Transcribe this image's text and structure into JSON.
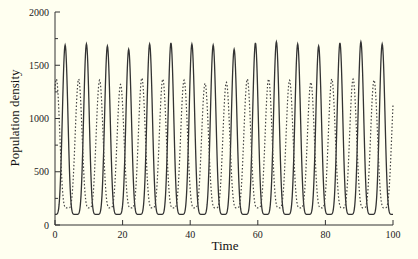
{
  "chart_data": {
    "type": "line",
    "title": "",
    "xlabel": "Time",
    "ylabel": "Population density",
    "xlim": [
      0,
      100
    ],
    "ylim": [
      0,
      2000
    ],
    "xticks": [
      0,
      20,
      40,
      60,
      80,
      100
    ],
    "yticks": [
      0,
      500,
      1000,
      1500,
      2000
    ],
    "xtick_labels": [
      "0",
      "20",
      "40",
      "60",
      "80",
      "100"
    ],
    "ytick_labels": [
      "0",
      "500",
      "1000",
      "1500",
      "2000"
    ],
    "grid": false,
    "legend": null,
    "series": [
      {
        "name": "solid",
        "style": "solid",
        "color": "#333333",
        "period": 6.25,
        "first_peak_time": 3.0,
        "peak_value": 1700,
        "trough_value": 100,
        "start_value": 120,
        "peaks": [
          {
            "t": 3.0,
            "v": 1690
          },
          {
            "t": 9.3,
            "v": 1700
          },
          {
            "t": 15.5,
            "v": 1680
          },
          {
            "t": 21.8,
            "v": 1650
          },
          {
            "t": 28.0,
            "v": 1700
          },
          {
            "t": 34.3,
            "v": 1710
          },
          {
            "t": 40.5,
            "v": 1700
          },
          {
            "t": 46.8,
            "v": 1690
          },
          {
            "t": 53.0,
            "v": 1650
          },
          {
            "t": 59.3,
            "v": 1710
          },
          {
            "t": 65.5,
            "v": 1720
          },
          {
            "t": 71.8,
            "v": 1700
          },
          {
            "t": 78.0,
            "v": 1680
          },
          {
            "t": 84.3,
            "v": 1710
          },
          {
            "t": 90.5,
            "v": 1720
          },
          {
            "t": 96.8,
            "v": 1700
          }
        ],
        "end_value": 1680
      },
      {
        "name": "dashed",
        "style": "dashed",
        "color": "#444444",
        "period": 6.25,
        "first_peak_time": 1.4,
        "peak_value": 1370,
        "trough_value": 160,
        "start_value": 1300,
        "peaks": [
          {
            "t": 0.4,
            "v": 1370
          },
          {
            "t": 7.0,
            "v": 1370
          },
          {
            "t": 13.2,
            "v": 1360
          },
          {
            "t": 19.4,
            "v": 1320
          },
          {
            "t": 25.7,
            "v": 1380
          },
          {
            "t": 31.9,
            "v": 1370
          },
          {
            "t": 38.2,
            "v": 1360
          },
          {
            "t": 44.4,
            "v": 1330
          },
          {
            "t": 50.7,
            "v": 1340
          },
          {
            "t": 56.9,
            "v": 1370
          },
          {
            "t": 63.2,
            "v": 1370
          },
          {
            "t": 69.4,
            "v": 1360
          },
          {
            "t": 75.7,
            "v": 1340
          },
          {
            "t": 81.9,
            "v": 1370
          },
          {
            "t": 88.2,
            "v": 1370
          },
          {
            "t": 94.4,
            "v": 1360
          }
        ],
        "end_value": 170
      }
    ]
  }
}
